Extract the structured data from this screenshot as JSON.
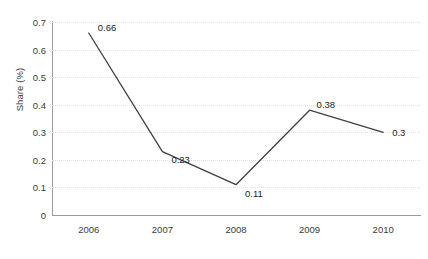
{
  "chart_data": {
    "type": "line",
    "title": "",
    "xlabel": "",
    "ylabel": "Share (%)",
    "categories": [
      "2006",
      "2007",
      "2008",
      "2009",
      "2010"
    ],
    "values": [
      0.66,
      0.23,
      0.11,
      0.38,
      0.3
    ],
    "data_labels": [
      "0.66",
      "0.23",
      "0.11",
      "0.38",
      "0.3"
    ],
    "series": [
      {
        "name": "Share (%)",
        "values": [
          0.66,
          0.23,
          0.11,
          0.38,
          0.3
        ]
      }
    ],
    "ylim": [
      0,
      0.7
    ],
    "y_ticks": [
      "0",
      "0.1",
      "0.2",
      "0.3",
      "0.4",
      "0.5",
      "0.6",
      "0.7"
    ],
    "y_tick_values": [
      0,
      0.1,
      0.2,
      0.3,
      0.4,
      0.5,
      0.6,
      0.7
    ],
    "x_ticks": [
      "2006",
      "2007",
      "2008",
      "2009",
      "2010"
    ],
    "grid": "horizontal-dotted",
    "legend": "none",
    "markers": "none",
    "colors": {
      "line": "#404040",
      "gridline": "#e2e2e2",
      "axis": "#9b9b9b",
      "text": "#3a3a3a",
      "background": "#ffffff"
    }
  }
}
